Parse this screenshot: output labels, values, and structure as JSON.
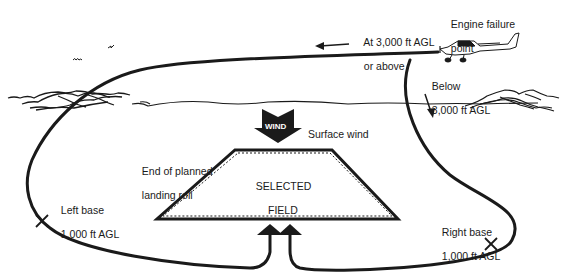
{
  "diagram": {
    "type": "emergency-landing-pattern",
    "colors": {
      "ink": "#1a1a1a",
      "background": "#ffffff",
      "wind_text": "#ffffff"
    },
    "labels": {
      "engine_failure_line1": "Engine failure",
      "engine_failure_line2": "point",
      "above_line1": "At 3,000 ft AGL",
      "above_line2": "or above",
      "below_line1": "Below",
      "below_line2": "3,000 ft AGL",
      "wind_arrow_text": "WIND",
      "surface_wind": "Surface wind",
      "end_roll_line1": "End of planned",
      "end_roll_line2": "landing roll",
      "field_line1": "SELECTED",
      "field_line2": "FIELD",
      "left_base_line1": "Left base",
      "left_base_line2": "1,000 ft AGL",
      "right_base_line1": "Right base",
      "right_base_line2": "1,000 ft AGL"
    },
    "elements": [
      {
        "name": "aircraft",
        "icon": "airplane-icon"
      },
      {
        "name": "wind-arrow",
        "icon": "down-chevron-arrow"
      },
      {
        "name": "selected-field",
        "shape": "trapezoid"
      },
      {
        "name": "left-pattern-path",
        "marker": "left-base-x"
      },
      {
        "name": "right-pattern-path",
        "marker": "right-base-x"
      },
      {
        "name": "approach-arrows",
        "count": 2
      },
      {
        "name": "birds",
        "count": 2
      },
      {
        "name": "mountains-left"
      },
      {
        "name": "mountains-right"
      },
      {
        "name": "horizon-line"
      }
    ]
  }
}
